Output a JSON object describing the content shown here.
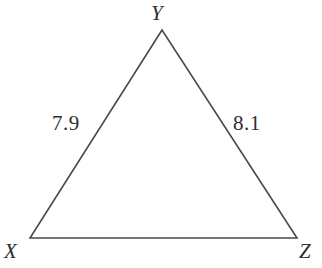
{
  "figure": {
    "name": "triangle-xyz",
    "background_color": "#ffffff",
    "stroke_color": "#4a4a4e",
    "text_color": "#2e2e30",
    "stroke_width": 1.6
  },
  "vertices": [
    {
      "id": "Y",
      "label": "Y",
      "x": 162,
      "y": 30
    },
    {
      "id": "X",
      "label": "X",
      "x": 30,
      "y": 238
    },
    {
      "id": "Z",
      "label": "Z",
      "x": 297,
      "y": 238
    }
  ],
  "sides": [
    {
      "id": "XY",
      "label": "7.9",
      "from": "X",
      "to": "Y"
    },
    {
      "id": "YZ",
      "label": "8.1",
      "from": "Y",
      "to": "Z"
    },
    {
      "id": "XZ",
      "label": "",
      "from": "X",
      "to": "Z"
    }
  ],
  "chart_data": {
    "type": "diagram",
    "title": "",
    "shape": "triangle",
    "categories": [
      "XY",
      "YZ",
      "XZ"
    ],
    "values": [
      7.9,
      8.1,
      null
    ],
    "labels": [
      "7.9",
      "8.1",
      ""
    ],
    "vertex_labels": [
      "X",
      "Y",
      "Z"
    ],
    "annotations": [
      "7.9",
      "8.1"
    ]
  }
}
